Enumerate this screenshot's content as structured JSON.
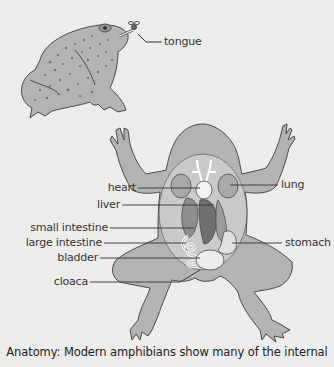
{
  "figure": {
    "colors": {
      "background": "#ececec",
      "body_fill": "#b3b3b3",
      "outline": "#4a4a4a",
      "organ_fill": "#e8e8e8",
      "text": "#333333"
    },
    "top_illustration": {
      "subject": "toad catching fly with tongue",
      "labels": [
        {
          "text": "tongue"
        }
      ]
    },
    "labels_left": [
      {
        "text": "heart"
      },
      {
        "text": "liver"
      },
      {
        "text": "small intestine"
      },
      {
        "text": "large intestine"
      },
      {
        "text": "bladder"
      },
      {
        "text": "cloaca"
      }
    ],
    "labels_right": [
      {
        "text": "lung"
      },
      {
        "text": "stomach"
      }
    ],
    "caption": "Anatomy: Modern amphibians show many of the internal"
  }
}
